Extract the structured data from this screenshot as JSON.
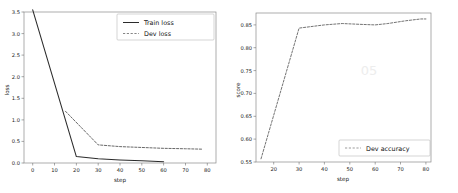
{
  "figure": {
    "background": "#ffffff",
    "line_color": "#2b2b2b",
    "dev_color": "#4d4d4d"
  },
  "chart_data": [
    {
      "type": "line",
      "panel": "left",
      "title": "",
      "xlabel": "step",
      "ylabel": "loss",
      "xlim": [
        -4,
        84
      ],
      "ylim": [
        -0.18,
        3.72
      ],
      "xticks": [
        0,
        10,
        20,
        30,
        40,
        50,
        60,
        70,
        80
      ],
      "xtick_labels": [
        "0",
        "10",
        "20",
        "30",
        "40",
        "50",
        "60",
        "70",
        "80"
      ],
      "yticks": [
        0.0,
        0.5,
        1.0,
        1.5,
        2.0,
        2.5,
        3.0,
        3.5
      ],
      "ytick_labels": [
        "0.0",
        "0.5",
        "1.0",
        "1.5",
        "2.0",
        "2.5",
        "3.0",
        "3.5"
      ],
      "grid": false,
      "legend_position": "upper right",
      "series": [
        {
          "name": "Train loss",
          "style": "solid",
          "x": [
            0,
            20,
            30,
            40,
            50,
            60
          ],
          "values": [
            3.55,
            0.15,
            0.1,
            0.07,
            0.05,
            0.03
          ]
        },
        {
          "name": "Dev loss",
          "style": "dashed",
          "x": [
            15,
            30,
            40,
            50,
            60,
            70,
            78
          ],
          "values": [
            1.2,
            0.42,
            0.38,
            0.36,
            0.34,
            0.33,
            0.32
          ]
        }
      ]
    },
    {
      "type": "line",
      "panel": "right",
      "title": "",
      "xlabel": "step",
      "ylabel": "score",
      "xlim": [
        13,
        82
      ],
      "ylim": [
        0.543,
        0.872
      ],
      "xticks": [
        20,
        30,
        40,
        50,
        60,
        70,
        80
      ],
      "xtick_labels": [
        "20",
        "30",
        "40",
        "50",
        "60",
        "70",
        "80"
      ],
      "yticks": [
        0.55,
        0.6,
        0.65,
        0.7,
        0.75,
        0.8,
        0.85
      ],
      "ytick_labels": [
        "0.55",
        "0.60",
        "0.65",
        "0.70",
        "0.75",
        "0.80",
        "0.85"
      ],
      "grid": false,
      "legend_position": "lower right",
      "series": [
        {
          "name": "Dev accuracy",
          "style": "dashed",
          "x": [
            15,
            30,
            40,
            47,
            55,
            60,
            65,
            72,
            78,
            80
          ],
          "values": [
            0.557,
            0.843,
            0.85,
            0.853,
            0.851,
            0.85,
            0.853,
            0.859,
            0.863,
            0.863
          ]
        }
      ]
    }
  ]
}
